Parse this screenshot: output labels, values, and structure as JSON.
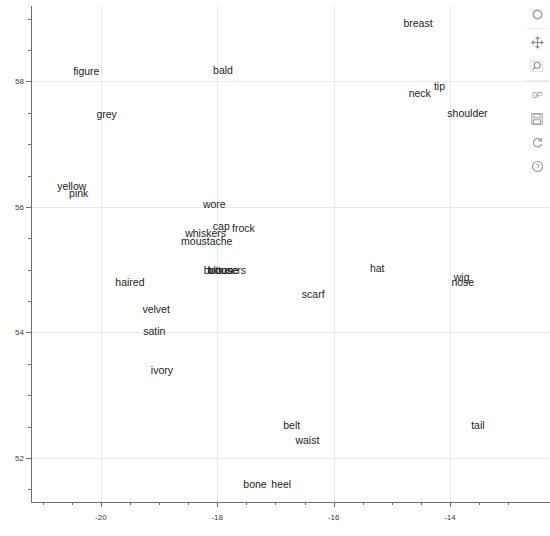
{
  "chart_data": {
    "type": "scatter",
    "title": "",
    "xlabel": "",
    "ylabel": "",
    "xlim": [
      -21.2,
      -12.9
    ],
    "ylim": [
      51.3,
      59.2
    ],
    "grid": true,
    "legend": "none",
    "xticks": [
      "-20",
      "-18",
      "-16",
      "-14"
    ],
    "xtick_values": [
      -20,
      -18,
      -16,
      -14
    ],
    "yticks": [
      "52",
      "54",
      "56",
      "58"
    ],
    "ytick_values": [
      52,
      54,
      56,
      58
    ],
    "minor_ticks": true,
    "marker_style": "text-only",
    "points": [
      {
        "label": "breast",
        "x": -14.55,
        "y": 58.93
      },
      {
        "label": "figure",
        "x": -20.25,
        "y": 58.17
      },
      {
        "label": "bald",
        "x": -17.9,
        "y": 58.18
      },
      {
        "label": "neck",
        "x": -14.52,
        "y": 57.82
      },
      {
        "label": "tip",
        "x": -14.18,
        "y": 57.93
      },
      {
        "label": "grey",
        "x": -19.9,
        "y": 57.48
      },
      {
        "label": "shoulder",
        "x": -13.7,
        "y": 57.5
      },
      {
        "label": "yellow",
        "x": -20.5,
        "y": 56.33
      },
      {
        "label": "pink",
        "x": -20.38,
        "y": 56.22
      },
      {
        "label": "wore",
        "x": -18.05,
        "y": 56.05
      },
      {
        "label": "cap",
        "x": -17.93,
        "y": 55.7
      },
      {
        "label": "frock",
        "x": -17.55,
        "y": 55.66
      },
      {
        "label": "whiskers",
        "x": -18.2,
        "y": 55.58
      },
      {
        "label": "moustache",
        "x": -18.18,
        "y": 55.45
      },
      {
        "label": "hat",
        "x": -15.25,
        "y": 55.02
      },
      {
        "label": "button",
        "x": -17.98,
        "y": 55.0
      },
      {
        "label": "blouse",
        "x": -17.9,
        "y": 55.0
      },
      {
        "label": "trousers",
        "x": -17.83,
        "y": 55.0
      },
      {
        "label": "wig",
        "x": -13.8,
        "y": 54.88
      },
      {
        "label": "nose",
        "x": -13.78,
        "y": 54.8
      },
      {
        "label": "haired",
        "x": -19.5,
        "y": 54.8
      },
      {
        "label": "scarf",
        "x": -16.35,
        "y": 54.62
      },
      {
        "label": "velvet",
        "x": -19.05,
        "y": 54.38
      },
      {
        "label": "satin",
        "x": -19.08,
        "y": 54.02
      },
      {
        "label": "ivory",
        "x": -18.95,
        "y": 53.4
      },
      {
        "label": "belt",
        "x": -16.72,
        "y": 52.52
      },
      {
        "label": "tail",
        "x": -13.52,
        "y": 52.52
      },
      {
        "label": "waist",
        "x": -16.45,
        "y": 52.28
      },
      {
        "label": "bone",
        "x": -17.35,
        "y": 51.58
      },
      {
        "label": "heel",
        "x": -16.9,
        "y": 51.58
      }
    ]
  },
  "toolbar": {
    "items": [
      {
        "icon": "home-icon",
        "tooltip": "Reset original view"
      },
      {
        "icon": "move-icon",
        "tooltip": "Pan axes with left mouse, zoom with right"
      },
      {
        "icon": "zoom-icon",
        "tooltip": "Zoom to rectangle"
      },
      {
        "icon": "subplot-config-icon",
        "tooltip": "Configure subplots",
        "text": "0P"
      },
      {
        "icon": "save-icon",
        "tooltip": "Save the figure"
      },
      {
        "icon": "refresh-icon",
        "tooltip": "Refresh"
      },
      {
        "icon": "help-icon",
        "tooltip": "Help"
      }
    ]
  },
  "colors": {
    "grid": "#e9e9ec",
    "axis": "#6f6f6f",
    "label_text": "#1c1c1c",
    "tick_text": "#3a3a3a",
    "toolbar_icon": "#9a9a9a",
    "background": "#ffffff"
  }
}
